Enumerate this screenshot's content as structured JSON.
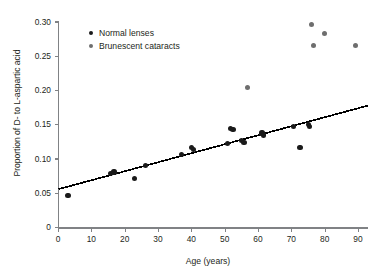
{
  "chart_data": {
    "type": "scatter",
    "title": "",
    "xlabel": "Age (years)",
    "ylabel": "Proportion of D- to L-aspartic acid",
    "xlim": [
      0,
      93
    ],
    "ylim": [
      0,
      0.305
    ],
    "xticks": [
      0,
      10,
      20,
      30,
      40,
      50,
      60,
      70,
      80,
      90
    ],
    "xtick_labels": [
      "0",
      "10",
      "20",
      "30",
      "40",
      "50",
      "60",
      "70",
      "80",
      "90"
    ],
    "yticks": [
      0,
      0.05,
      0.1,
      0.15,
      0.2,
      0.25,
      0.3
    ],
    "ytick_labels": [
      "0",
      "0.05",
      "0.10",
      "0.15",
      "0.20",
      "0.25",
      "0.30"
    ],
    "grid": false,
    "legend_position": "top-left-inside",
    "series": [
      {
        "name": "Normal lenses",
        "marker": "filled-circle",
        "color": "#1a1a1a",
        "points": [
          {
            "x": 3.0,
            "y": 0.047
          },
          {
            "x": 15.7,
            "y": 0.079
          },
          {
            "x": 16.8,
            "y": 0.081
          },
          {
            "x": 23.0,
            "y": 0.072
          },
          {
            "x": 26.2,
            "y": 0.09
          },
          {
            "x": 37.0,
            "y": 0.107
          },
          {
            "x": 40.0,
            "y": 0.117
          },
          {
            "x": 40.6,
            "y": 0.114
          },
          {
            "x": 50.9,
            "y": 0.123
          },
          {
            "x": 51.8,
            "y": 0.145
          },
          {
            "x": 52.5,
            "y": 0.143
          },
          {
            "x": 55.0,
            "y": 0.127
          },
          {
            "x": 55.8,
            "y": 0.124
          },
          {
            "x": 61.2,
            "y": 0.138
          },
          {
            "x": 61.6,
            "y": 0.135
          },
          {
            "x": 70.7,
            "y": 0.148
          },
          {
            "x": 72.6,
            "y": 0.117
          },
          {
            "x": 75.1,
            "y": 0.15
          },
          {
            "x": 75.4,
            "y": 0.148
          }
        ]
      },
      {
        "name": "Brunescent cataracts",
        "marker": "filled-circle",
        "color": "#6e6e6e",
        "points": [
          {
            "x": 56.8,
            "y": 0.204
          },
          {
            "x": 75.9,
            "y": 0.296
          },
          {
            "x": 76.5,
            "y": 0.265
          },
          {
            "x": 80.0,
            "y": 0.283
          },
          {
            "x": 89.2,
            "y": 0.265
          }
        ]
      }
    ],
    "trendline": {
      "type": "linear-regression",
      "x_start": 0,
      "y_start": 0.056,
      "x_end": 93,
      "y_end": 0.178,
      "color": "#000000"
    }
  },
  "legend": {
    "items": [
      {
        "label": "Normal lenses",
        "color": "#1a1a1a"
      },
      {
        "label": "Brunescent cataracts",
        "color": "#6e6e6e"
      }
    ]
  }
}
